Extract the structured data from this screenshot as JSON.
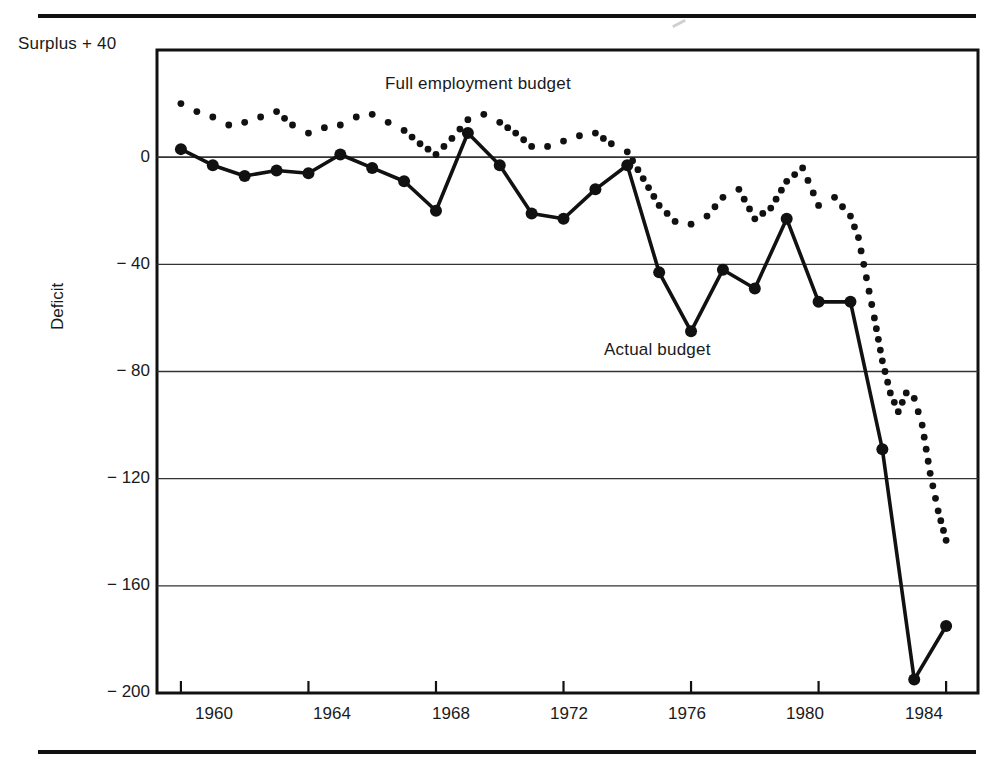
{
  "axis": {
    "surplus_label": "Surplus + 40",
    "deficit_label": "Deficit",
    "yticks": [
      "0",
      "− 40",
      "− 80",
      "− 120",
      "− 160",
      "− 200"
    ],
    "xticks": [
      "1960",
      "1964",
      "1968",
      "1972",
      "1976",
      "1980",
      "1984"
    ]
  },
  "labels": {
    "full_employment": "Full employment budget",
    "actual": "Actual budget"
  },
  "colors": {
    "ink": "#111111",
    "gridline": "#333333",
    "background": "#ffffff"
  },
  "chart_data": {
    "type": "line",
    "title": "",
    "xlabel": "",
    "ylabel": "Deficit",
    "xlim": [
      1959,
      1985
    ],
    "ylim": [
      -200,
      40
    ],
    "yticks": [
      40,
      0,
      -40,
      -80,
      -120,
      -160,
      -200
    ],
    "xticks": [
      1960,
      1964,
      1968,
      1972,
      1976,
      1980,
      1984
    ],
    "grid": "horizontal",
    "legend": "inline-annotations",
    "x": [
      1960,
      1961,
      1962,
      1963,
      1964,
      1965,
      1966,
      1967,
      1968,
      1969,
      1970,
      1971,
      1972,
      1973,
      1974,
      1975,
      1976,
      1977,
      1978,
      1979,
      1980,
      1981,
      1982,
      1983,
      1984
    ],
    "series": [
      {
        "name": "Actual budget",
        "style": "solid-with-markers",
        "values": [
          3,
          -3,
          -7,
          -5,
          -6,
          1,
          -4,
          -9,
          -20,
          9,
          -3,
          -21,
          -23,
          -12,
          -3,
          -43,
          -65,
          -42,
          -49,
          -23,
          -54,
          -54,
          -109,
          -195,
          -175
        ]
      },
      {
        "name": "Full employment budget",
        "style": "dotted",
        "values": [
          20,
          15,
          13,
          17,
          9,
          12,
          16,
          10,
          1,
          14,
          13,
          4,
          6,
          9,
          2,
          -18,
          -25,
          -15,
          -23,
          -9,
          -18,
          -22,
          -25,
          -90,
          -143
        ]
      }
    ],
    "full_employment_dense_x": [
      1960,
      1960.5,
      1961,
      1961.5,
      1962,
      1962.5,
      1963,
      1963.5,
      1964,
      1964.5,
      1965,
      1965.5,
      1966,
      1966.5,
      1967,
      1967.5,
      1968,
      1968.5,
      1969,
      1969.5,
      1970,
      1970.5,
      1971,
      1971.5,
      1972,
      1972.5,
      1973,
      1973.5,
      1974,
      1974.5,
      1975,
      1975.5,
      1976,
      1976.5,
      1977,
      1977.5,
      1978,
      1978.5,
      1979,
      1979.5,
      1980,
      1980.5,
      1981,
      1981.25,
      1981.5,
      1981.75,
      1982,
      1982.25,
      1982.5,
      1982.75,
      1983,
      1983.25,
      1983.5,
      1983.75,
      1984
    ],
    "full_employment_dense_y": [
      20,
      17,
      15,
      12,
      13,
      15,
      17,
      12,
      9,
      11,
      12,
      15,
      16,
      13,
      10,
      5,
      1,
      7,
      14,
      16,
      13,
      9,
      4,
      4,
      6,
      8,
      9,
      5,
      2,
      -8,
      -18,
      -24,
      -25,
      -22,
      -15,
      -12,
      -23,
      -19,
      -9,
      -4,
      -18,
      -15,
      -22,
      -30,
      -45,
      -60,
      -76,
      -88,
      -95,
      -88,
      -90,
      -100,
      -118,
      -132,
      -143
    ]
  }
}
